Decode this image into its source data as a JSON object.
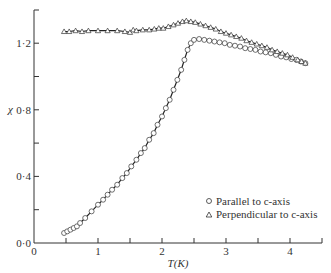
{
  "chart_data": {
    "type": "scatter",
    "title": "",
    "xlabel": "T(K)",
    "ylabel": "χ",
    "xlim": [
      0,
      4.5
    ],
    "ylim": [
      0,
      1.4
    ],
    "x_ticks": [
      0,
      0.5,
      1,
      1.5,
      2,
      2.5,
      3,
      3.5,
      4,
      4.5
    ],
    "x_tick_labels": [
      "0",
      "",
      "1",
      "",
      "2",
      "",
      "3",
      "",
      "4",
      ""
    ],
    "y_ticks": [
      0,
      0.2,
      0.4,
      0.6,
      0.8,
      1.0,
      1.2,
      1.4
    ],
    "y_tick_labels": [
      "0·0",
      "",
      "0·4",
      "",
      "0·8",
      "",
      "1·2",
      ""
    ],
    "grid": false,
    "legend": "bottom-right",
    "series": [
      {
        "name": "Parallel to c-axis",
        "marker": "circle",
        "x": [
          0.47,
          0.52,
          0.57,
          0.62,
          0.67,
          0.72,
          0.8,
          0.9,
          1.0,
          1.08,
          1.15,
          1.22,
          1.3,
          1.38,
          1.45,
          1.52,
          1.6,
          1.67,
          1.73,
          1.8,
          1.87,
          1.93,
          2.0,
          2.06,
          2.12,
          2.18,
          2.24,
          2.3,
          2.35,
          2.4,
          2.45,
          2.5,
          2.58,
          2.66,
          2.74,
          2.82,
          2.9,
          2.98,
          3.06,
          3.14,
          3.22,
          3.3,
          3.38,
          3.46,
          3.54,
          3.62,
          3.7,
          3.78,
          3.86,
          3.94,
          4.02,
          4.1,
          4.17,
          4.24
        ],
        "y": [
          0.06,
          0.07,
          0.08,
          0.09,
          0.1,
          0.12,
          0.15,
          0.19,
          0.23,
          0.26,
          0.29,
          0.32,
          0.35,
          0.39,
          0.42,
          0.46,
          0.5,
          0.54,
          0.57,
          0.62,
          0.66,
          0.71,
          0.76,
          0.81,
          0.86,
          0.92,
          0.98,
          1.04,
          1.1,
          1.16,
          1.2,
          1.22,
          1.225,
          1.22,
          1.215,
          1.21,
          1.205,
          1.2,
          1.19,
          1.185,
          1.18,
          1.17,
          1.165,
          1.16,
          1.15,
          1.145,
          1.14,
          1.13,
          1.12,
          1.115,
          1.105,
          1.1,
          1.09,
          1.08
        ]
      },
      {
        "name": "Perpendicular to c-axis",
        "marker": "triangle",
        "x": [
          0.47,
          0.55,
          0.65,
          0.75,
          0.85,
          1.0,
          1.15,
          1.3,
          1.42,
          1.5,
          1.55,
          1.6,
          1.7,
          1.8,
          1.88,
          1.95,
          2.02,
          2.1,
          2.18,
          2.25,
          2.32,
          2.38,
          2.45,
          2.52,
          2.6,
          2.68,
          2.76,
          2.84,
          2.92,
          3.0,
          3.08,
          3.16,
          3.24,
          3.32,
          3.4,
          3.48,
          3.56,
          3.64,
          3.72,
          3.8,
          3.88,
          3.96,
          4.04,
          4.12,
          4.18,
          4.24
        ],
        "y": [
          1.27,
          1.27,
          1.275,
          1.27,
          1.275,
          1.275,
          1.275,
          1.275,
          1.27,
          1.265,
          1.28,
          1.275,
          1.28,
          1.28,
          1.285,
          1.29,
          1.29,
          1.3,
          1.31,
          1.32,
          1.33,
          1.335,
          1.33,
          1.325,
          1.315,
          1.305,
          1.295,
          1.285,
          1.27,
          1.26,
          1.25,
          1.24,
          1.23,
          1.215,
          1.205,
          1.195,
          1.185,
          1.175,
          1.16,
          1.15,
          1.14,
          1.13,
          1.115,
          1.1,
          1.09,
          1.08
        ]
      }
    ]
  }
}
